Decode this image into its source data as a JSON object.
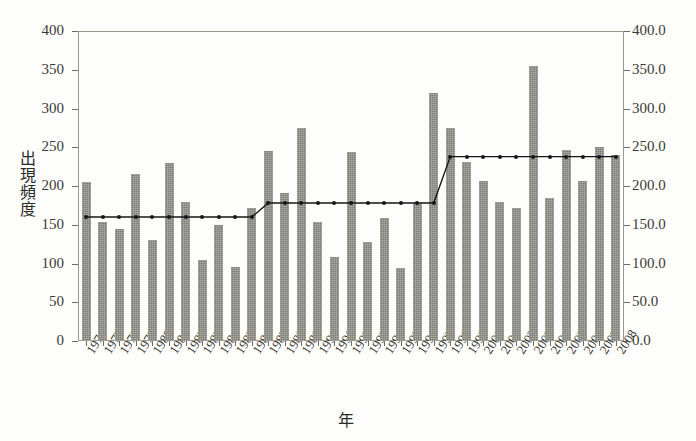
{
  "figure": {
    "background": "#fdfdfb",
    "bar_color": "#7e7e76",
    "line_color": "#17171a",
    "axis_color": "#9a9a90"
  },
  "chart_data": {
    "type": "bar",
    "title": "",
    "xlabel": "年",
    "ylabel": "出現頻度",
    "ylim": [
      0,
      400
    ],
    "ylim_right": [
      0,
      400
    ],
    "grid": false,
    "legend": null,
    "yticks": [
      0,
      50,
      100,
      150,
      200,
      250,
      300,
      350,
      400
    ],
    "ytick_labels_left": [
      "0",
      "50",
      "100",
      "150",
      "200",
      "250",
      "300",
      "350",
      "400"
    ],
    "ytick_labels_right": [
      "0.0",
      "50.0",
      "100.0",
      "150.0",
      "200.0",
      "250.0",
      "300.0",
      "350.0",
      "400.0"
    ],
    "categories": [
      "1976",
      "1977",
      "1978",
      "1979",
      "1980",
      "1981",
      "1982",
      "1983",
      "1984",
      "1985",
      "1986",
      "1987",
      "1988",
      "1989",
      "1990",
      "1991",
      "1992",
      "1993",
      "1994",
      "1995",
      "1996",
      "1997",
      "1998",
      "1999",
      "2000",
      "2001",
      "2002",
      "2003",
      "2004",
      "2005",
      "2006",
      "2007",
      "2008"
    ],
    "series": [
      {
        "name": "出現頻度",
        "type": "bar",
        "values": [
          205,
          154,
          145,
          216,
          130,
          230,
          180,
          105,
          150,
          95,
          172,
          245,
          191,
          275,
          153,
          108,
          244,
          128,
          159,
          94,
          178,
          320,
          275,
          231,
          206,
          179,
          172,
          355,
          185,
          246,
          206,
          250,
          240
        ]
      },
      {
        "name": "平均水準 (step)",
        "type": "line",
        "values": [
          160,
          160,
          160,
          160,
          160,
          160,
          160,
          160,
          160,
          160,
          160,
          178,
          178,
          178,
          178,
          178,
          178,
          178,
          178,
          178,
          178,
          178,
          238,
          238,
          238,
          238,
          238,
          238,
          238,
          238,
          238,
          238,
          238
        ]
      }
    ]
  }
}
